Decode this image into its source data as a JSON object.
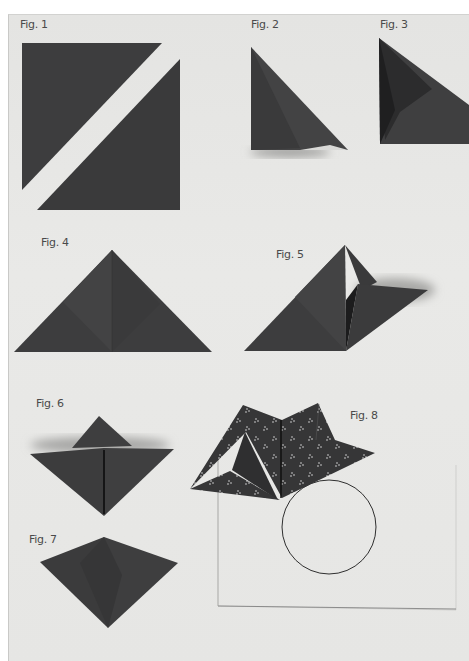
{
  "page": {
    "background": "#e6e6e4",
    "paper_color": "#3b3b3c",
    "figures": [
      {
        "id": 1,
        "label": "Fig. 1"
      },
      {
        "id": 2,
        "label": "Fig. 2"
      },
      {
        "id": 3,
        "label": "Fig. 3"
      },
      {
        "id": 4,
        "label": "Fig. 4"
      },
      {
        "id": 5,
        "label": "Fig. 5"
      },
      {
        "id": 6,
        "label": "Fig. 6"
      },
      {
        "id": 7,
        "label": "Fig. 7"
      },
      {
        "id": 8,
        "label": "Fig. 8"
      }
    ]
  }
}
